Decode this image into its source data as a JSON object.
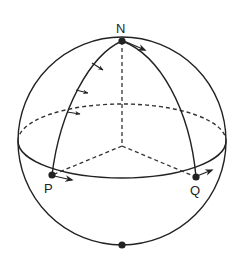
{
  "diagram": {
    "type": "sphere-parallel-transport",
    "labels": {
      "north_pole": "N",
      "point_p": "P",
      "point_q": "Q"
    },
    "colors": {
      "stroke": "#222222",
      "background": "#ffffff"
    }
  }
}
